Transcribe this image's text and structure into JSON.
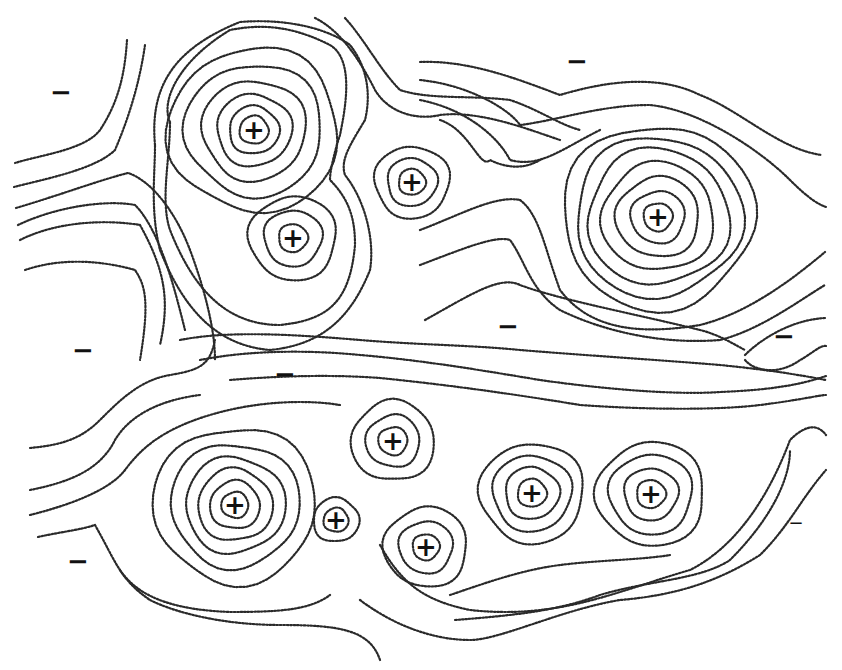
{
  "figure": {
    "type": "dotted contour map",
    "line_style": "dotted",
    "line_color": "#2a2a2a",
    "background": "#ffffff"
  },
  "markers": {
    "positive": [
      {
        "symbol": "+",
        "x": 254,
        "y": 130
      },
      {
        "symbol": "+",
        "x": 412,
        "y": 182
      },
      {
        "symbol": "+",
        "x": 293,
        "y": 238
      },
      {
        "symbol": "+",
        "x": 658,
        "y": 217
      },
      {
        "symbol": "+",
        "x": 393,
        "y": 441
      },
      {
        "symbol": "+",
        "x": 235,
        "y": 505
      },
      {
        "symbol": "+",
        "x": 336,
        "y": 520
      },
      {
        "symbol": "+",
        "x": 532,
        "y": 493
      },
      {
        "symbol": "+",
        "x": 651,
        "y": 494
      },
      {
        "symbol": "+",
        "x": 426,
        "y": 547
      }
    ],
    "negative": [
      {
        "symbol": "−",
        "x": 61,
        "y": 92
      },
      {
        "symbol": "−",
        "x": 577,
        "y": 61
      },
      {
        "symbol": "−",
        "x": 83,
        "y": 350
      },
      {
        "symbol": "−",
        "x": 508,
        "y": 326
      },
      {
        "symbol": "−",
        "x": 285,
        "y": 374
      },
      {
        "symbol": "−",
        "x": 784,
        "y": 336
      },
      {
        "symbol": "−",
        "x": 78,
        "y": 561
      },
      {
        "symbol": "−",
        "x": 796,
        "y": 523
      }
    ]
  },
  "centers": [
    {
      "id": "p1",
      "x": 254,
      "y": 130,
      "rings": [
        14,
        24,
        36,
        50,
        66,
        82
      ]
    },
    {
      "id": "p2",
      "x": 412,
      "y": 182,
      "rings": [
        13,
        24,
        36
      ]
    },
    {
      "id": "p3",
      "x": 293,
      "y": 238,
      "rings": [
        14,
        28,
        42
      ]
    },
    {
      "id": "p4",
      "x": 658,
      "y": 217,
      "rings": [
        14,
        26,
        40,
        54,
        68,
        80,
        92
      ]
    },
    {
      "id": "p5",
      "x": 393,
      "y": 441,
      "rings": [
        14,
        26,
        40
      ]
    },
    {
      "id": "p6",
      "x": 235,
      "y": 505,
      "rings": [
        13,
        24,
        36,
        48,
        62,
        78
      ]
    },
    {
      "id": "p7",
      "x": 336,
      "y": 520,
      "rings": [
        12,
        22
      ]
    },
    {
      "id": "p8",
      "x": 532,
      "y": 493,
      "rings": [
        14,
        26,
        38,
        50
      ]
    },
    {
      "id": "p9",
      "x": 651,
      "y": 494,
      "rings": [
        14,
        26,
        40,
        52
      ]
    },
    {
      "id": "p10",
      "x": 426,
      "y": 547,
      "rings": [
        13,
        26,
        40
      ]
    }
  ]
}
